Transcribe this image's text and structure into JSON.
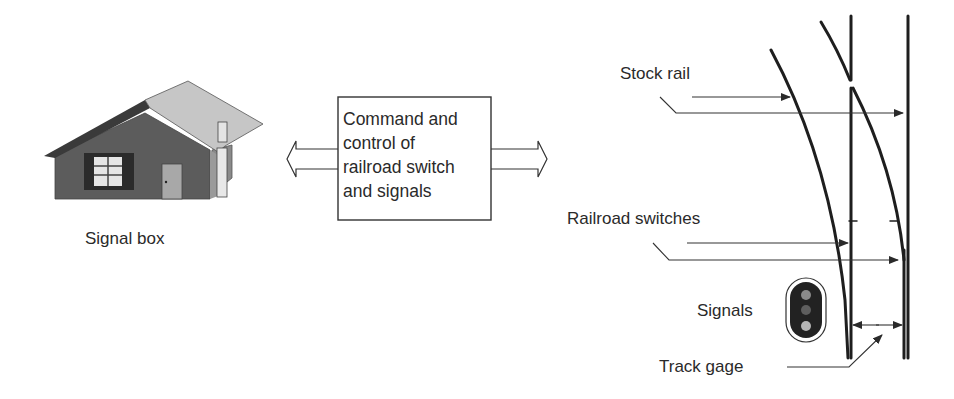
{
  "signal_box": {
    "label": "Signal box"
  },
  "command_box": {
    "lines": [
      "Command and",
      "control of",
      "railroad switch",
      "and signals"
    ]
  },
  "labels": {
    "stock_rail": "Stock rail",
    "railroad_switches": "Railroad switches",
    "signals": "Signals",
    "track_gage": "Track gage"
  },
  "colors": {
    "wall": "#5a5a5a",
    "roof_light": "#c4c4c4",
    "roof_dark": "#3a3a3a",
    "window_frame": "#2b2b2b",
    "window_glass": "#e6e6e6",
    "door": "#a8a8a8",
    "line": "#222222"
  }
}
